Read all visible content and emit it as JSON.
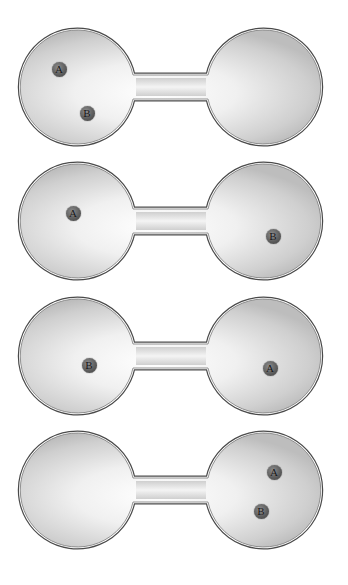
{
  "figure": {
    "panels": [
      {
        "id": 1,
        "top": 26,
        "particles": [
          {
            "label": "A",
            "x": 59,
            "y": 43
          },
          {
            "label": "B",
            "x": 87,
            "y": 87
          }
        ]
      },
      {
        "id": 2,
        "top": 160,
        "particles": [
          {
            "label": "A",
            "x": 73,
            "y": 53
          },
          {
            "label": "B",
            "x": 273,
            "y": 76
          }
        ]
      },
      {
        "id": 3,
        "top": 295,
        "particles": [
          {
            "label": "B",
            "x": 89,
            "y": 70
          },
          {
            "label": "A",
            "x": 270,
            "y": 73
          }
        ]
      },
      {
        "id": 4,
        "top": 429,
        "particles": [
          {
            "label": "A",
            "x": 274,
            "y": 43
          },
          {
            "label": "B",
            "x": 261,
            "y": 82
          }
        ]
      }
    ],
    "labels": {
      "p1a": "A",
      "p1b": "B",
      "p2a": "A",
      "p2b": "B",
      "p3a": "B",
      "p3b": "A",
      "p4a": "A",
      "p4b": "B"
    },
    "colors": {
      "outline": "#555555",
      "glass_fill": "#d9d9d9",
      "glass_highlight": "#ffffff",
      "particle": "#5e5e5e",
      "background": "#ffffff"
    }
  }
}
